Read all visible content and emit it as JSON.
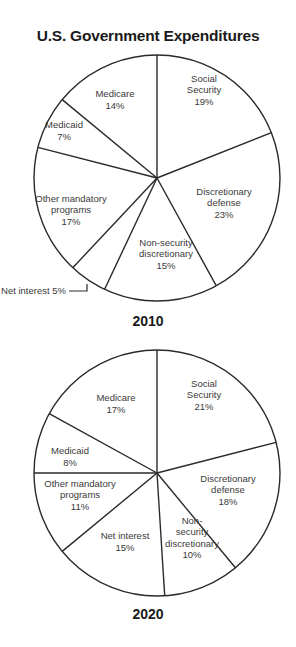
{
  "title": "U.S. Government Expenditures",
  "chart_data": [
    {
      "type": "pie",
      "title": "2010",
      "start_angle": "12 o'clock, clockwise",
      "categories": [
        "Social Security",
        "Discretionary defense",
        "Non-security discretionary",
        "Net interest",
        "Other mandatory programs",
        "Medicaid",
        "Medicare"
      ],
      "values": [
        19,
        23,
        15,
        5,
        17,
        7,
        14
      ],
      "labels": [
        {
          "lines": [
            "Social",
            "Security",
            "19%"
          ]
        },
        {
          "lines": [
            "Discretionary",
            "defense",
            "23%"
          ]
        },
        {
          "lines": [
            "Non-security",
            "discretionary",
            "15%"
          ]
        },
        {
          "lines": [
            "Net interest 5%"
          ],
          "callout": true
        },
        {
          "lines": [
            "Other mandatory",
            "programs",
            "17%"
          ]
        },
        {
          "lines": [
            "Medicaid",
            "7%"
          ]
        },
        {
          "lines": [
            "Medicare",
            "14%"
          ]
        }
      ],
      "unit": "%"
    },
    {
      "type": "pie",
      "title": "2020",
      "start_angle": "12 o'clock, clockwise",
      "categories": [
        "Social Security",
        "Discretionary defense",
        "Non-security discretionary",
        "Net interest",
        "Other mandatory programs",
        "Medicaid",
        "Medicare"
      ],
      "values": [
        21,
        18,
        10,
        15,
        11,
        8,
        17
      ],
      "labels": [
        {
          "lines": [
            "Social",
            "Security",
            "21%"
          ]
        },
        {
          "lines": [
            "Discretionary",
            "defense",
            "18%"
          ]
        },
        {
          "lines": [
            "Non-",
            "security",
            "discretionary",
            "10%"
          ]
        },
        {
          "lines": [
            "Net interest",
            "15%"
          ]
        },
        {
          "lines": [
            "Other mandatory",
            "programs",
            "11%"
          ]
        },
        {
          "lines": [
            "Medicaid",
            "8%"
          ]
        },
        {
          "lines": [
            "Medicare",
            "17%"
          ]
        }
      ],
      "unit": "%"
    }
  ],
  "years": {
    "first": "2010",
    "second": "2020"
  }
}
